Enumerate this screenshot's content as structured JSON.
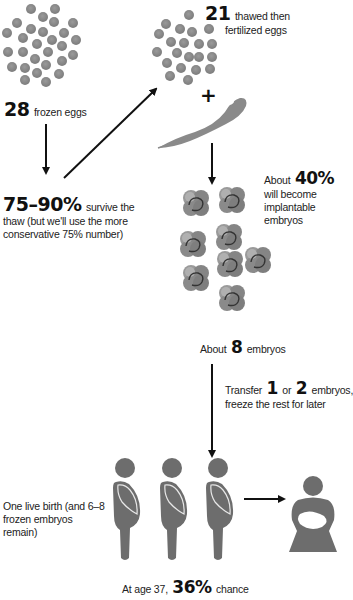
{
  "colors": {
    "egg_gray": "#8a8a8a",
    "embryo_gray": "#8c8c8c",
    "figure_gray": "#6d6d6d",
    "arrow_black": "#111111",
    "text": "#222222"
  },
  "steps": {
    "frozen": {
      "number": "28",
      "label": "frozen eggs"
    },
    "survive": {
      "number": "75–90%",
      "label_line1": "survive the",
      "label_line2": "thaw (but we'll use the more",
      "label_line3": "conservative 75% number)"
    },
    "thawed": {
      "number": "21",
      "label_line1": "thawed then",
      "label_line2": "fertilized eggs"
    },
    "plus": "+",
    "implantable": {
      "prefix": "About",
      "number": "40%",
      "line2": "will become",
      "line3": "implantable",
      "line4": "embryos"
    },
    "embryos": {
      "prefix": "About",
      "number": "8",
      "label": "embryos"
    },
    "transfer": {
      "prefix": "Transfer",
      "n1": "1",
      "mid": "or",
      "n2": "2",
      "suffix": "embryos,",
      "line2": "freeze the rest for later"
    },
    "outcome": {
      "line1": "One live birth (and 6–8",
      "line2": "frozen embryos remain)"
    },
    "chance": {
      "prefix": "At age 37,",
      "number": "36%",
      "suffix": "chance"
    }
  }
}
